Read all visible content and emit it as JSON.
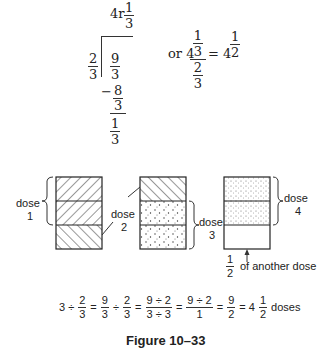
{
  "division": {
    "quotient_whole": "4r",
    "quotient_frac_num": "1",
    "quotient_frac_den": "3",
    "divisor_num": "2",
    "divisor_den": "3",
    "dividend_num": "9",
    "dividend_den": "3",
    "minus_sign": "−",
    "subtract_num": "8",
    "subtract_den": "3",
    "remainder_num": "1",
    "remainder_den": "3"
  },
  "alt": {
    "prefix": "or 4",
    "complex_top_num": "1",
    "complex_top_den": "3",
    "complex_bot_num": "2",
    "complex_bot_den": "3",
    "equals": "=",
    "result_whole": "4",
    "result_num": "1",
    "result_den": "2"
  },
  "diagram": {
    "dose1_label_line1": "dose",
    "dose1_label_line2": "1",
    "dose2_label_line1": "dose",
    "dose2_label_line2": "2",
    "dose3_label_line1": "dose",
    "dose3_label_line2": "3",
    "dose4_label_line1": "dose",
    "dose4_label_line2": "4",
    "half_num": "1",
    "half_den": "2",
    "half_caption": "of another dose"
  },
  "equation": {
    "t1": "3 ÷",
    "f1n": "2",
    "f1d": "3",
    "eq1": "=",
    "f2n": "9",
    "f2d": "3",
    "div1": "÷",
    "f3n": "2",
    "f3d": "3",
    "eq2": "=",
    "f4n": "9 ÷ 2",
    "f4d": "3 ÷ 3",
    "eq3": "=",
    "f5n": "9 ÷ 2",
    "f5d": "1",
    "eq4": "=",
    "f6n": "9",
    "f6d": "2",
    "eq5": "= 4",
    "f7n": "1",
    "f7d": "2",
    "tail": "doses"
  },
  "caption": "Figure 10–33"
}
